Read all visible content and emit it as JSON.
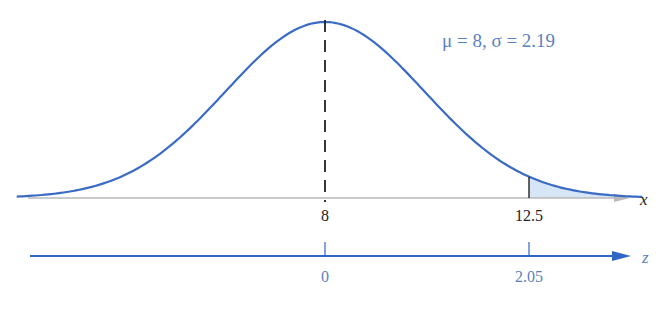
{
  "figure": {
    "params_label": "μ = 8, σ = 2.19",
    "distribution": {
      "mean": 8,
      "sd": 2.19,
      "x_min": 1.2,
      "x_max": 15.0
    },
    "x_axis": {
      "label": "x",
      "ticks": [
        {
          "value": 8,
          "label": "8"
        },
        {
          "value": 12.5,
          "label": "12.5"
        }
      ]
    },
    "z_axis": {
      "label": "z",
      "ticks": [
        {
          "value": 0,
          "label": "0"
        },
        {
          "value": 2.05,
          "label": "2.05"
        }
      ]
    },
    "shaded_region": {
      "from": 12.5,
      "to": "right tail"
    },
    "colors": {
      "curve": "#3b6cc4",
      "x_axis": "#b9b9b9",
      "z_axis": "#2f66c8",
      "shade": "#d6e6f7",
      "text_blue": "#5b7fc0",
      "text_black": "#222222"
    }
  },
  "chart_data": {
    "type": "line",
    "title": "",
    "subtitle": "μ = 8, σ = 2.19",
    "xlabel": "x",
    "secondary_xlabel": "z",
    "series": [
      {
        "name": "normal density",
        "mean": 8,
        "sd": 2.19
      }
    ],
    "x_ticks": [
      8,
      12.5
    ],
    "z_ticks": [
      0,
      2.05
    ],
    "shaded": {
      "x_from": 12.5,
      "side": "right"
    },
    "mean_marker": 8
  }
}
